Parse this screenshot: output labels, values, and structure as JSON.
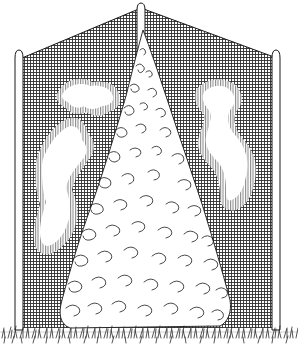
{
  "illustration": {
    "subject": "conical shrub in front of a netting screen",
    "style": "black-and-white pen line drawing",
    "colors": {
      "background": "#ffffff",
      "ink": "#1a1a1a",
      "net": "#3a3a3a"
    },
    "elements": {
      "posts": [
        "left-post",
        "center-post",
        "right-post"
      ],
      "netting": "windbreak-netting",
      "highlights": [
        "left-highlight-upper",
        "left-highlight-lower",
        "right-highlight"
      ],
      "shrub": "conical-conifer-shrub",
      "ground": "grass"
    }
  }
}
